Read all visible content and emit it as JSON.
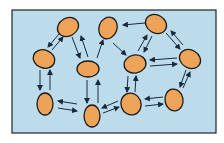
{
  "diagram": {
    "title": "",
    "frame": {
      "x": 12,
      "y": 10,
      "w": 204,
      "h": 123,
      "fill": "#bcdceb",
      "stroke": "#1a2530"
    },
    "node_style": {
      "fill": "#eea458",
      "stroke": "#1a1a1a"
    },
    "arrow_color": "#1a2a3a",
    "nodes": [
      {
        "id": "n1",
        "cx": 68,
        "cy": 27,
        "rx": 11,
        "ry": 9,
        "rot": -30
      },
      {
        "id": "n2",
        "cx": 108,
        "cy": 28,
        "rx": 9,
        "ry": 11,
        "rot": 20
      },
      {
        "id": "n3",
        "cx": 156,
        "cy": 24,
        "rx": 11,
        "ry": 9,
        "rot": 30
      },
      {
        "id": "n4",
        "cx": 44,
        "cy": 59,
        "rx": 11,
        "ry": 9,
        "rot": 20
      },
      {
        "id": "n5",
        "cx": 88,
        "cy": 69,
        "rx": 11,
        "ry": 8,
        "rot": 0
      },
      {
        "id": "n6",
        "cx": 135,
        "cy": 64,
        "rx": 11,
        "ry": 9,
        "rot": -10
      },
      {
        "id": "n7",
        "cx": 190,
        "cy": 59,
        "rx": 11,
        "ry": 9,
        "rot": 30
      },
      {
        "id": "n8",
        "cx": 45,
        "cy": 104,
        "rx": 8,
        "ry": 11,
        "rot": 0
      },
      {
        "id": "n9",
        "cx": 92,
        "cy": 116,
        "rx": 8,
        "ry": 11,
        "rot": 0
      },
      {
        "id": "n10",
        "cx": 131,
        "cy": 104,
        "rx": 10,
        "ry": 11,
        "rot": -20
      },
      {
        "id": "n11",
        "cx": 174,
        "cy": 100,
        "rx": 9,
        "ry": 11,
        "rot": -10
      }
    ],
    "arrows": [
      {
        "x1": 59,
        "y1": 34,
        "x2": 48,
        "y2": 47
      },
      {
        "x1": 52,
        "y1": 50,
        "x2": 63,
        "y2": 37
      },
      {
        "x1": 72,
        "y1": 37,
        "x2": 80,
        "y2": 58
      },
      {
        "x1": 88,
        "y1": 57,
        "x2": 81,
        "y2": 36
      },
      {
        "x1": 97,
        "y1": 58,
        "x2": 103,
        "y2": 40
      },
      {
        "x1": 113,
        "y1": 43,
        "x2": 126,
        "y2": 55
      },
      {
        "x1": 152,
        "y1": 36,
        "x2": 144,
        "y2": 52
      },
      {
        "x1": 138,
        "y1": 51,
        "x2": 147,
        "y2": 35
      },
      {
        "x1": 145,
        "y1": 23,
        "x2": 123,
        "y2": 25
      },
      {
        "x1": 166,
        "y1": 33,
        "x2": 180,
        "y2": 49
      },
      {
        "x1": 183,
        "y1": 45,
        "x2": 171,
        "y2": 31
      },
      {
        "x1": 177,
        "y1": 58,
        "x2": 150,
        "y2": 60
      },
      {
        "x1": 150,
        "y1": 66,
        "x2": 177,
        "y2": 64
      },
      {
        "x1": 186,
        "y1": 70,
        "x2": 180,
        "y2": 87
      },
      {
        "x1": 183,
        "y1": 88,
        "x2": 190,
        "y2": 72
      },
      {
        "x1": 40,
        "y1": 70,
        "x2": 40,
        "y2": 90
      },
      {
        "x1": 50,
        "y1": 90,
        "x2": 50,
        "y2": 70
      },
      {
        "x1": 87,
        "y1": 80,
        "x2": 87,
        "y2": 103
      },
      {
        "x1": 98,
        "y1": 103,
        "x2": 98,
        "y2": 80
      },
      {
        "x1": 77,
        "y1": 104,
        "x2": 58,
        "y2": 101
      },
      {
        "x1": 58,
        "y1": 108,
        "x2": 77,
        "y2": 111
      },
      {
        "x1": 118,
        "y1": 101,
        "x2": 102,
        "y2": 108
      },
      {
        "x1": 103,
        "y1": 113,
        "x2": 119,
        "y2": 107
      },
      {
        "x1": 128,
        "y1": 76,
        "x2": 127,
        "y2": 92
      },
      {
        "x1": 135,
        "y1": 92,
        "x2": 136,
        "y2": 76
      },
      {
        "x1": 163,
        "y1": 97,
        "x2": 145,
        "y2": 99
      },
      {
        "x1": 145,
        "y1": 106,
        "x2": 163,
        "y2": 104
      }
    ]
  }
}
